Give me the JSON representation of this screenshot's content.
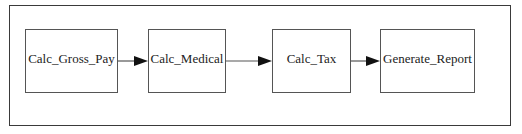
{
  "diagram": {
    "type": "flowchart",
    "direction": "left-to-right",
    "nodes": [
      {
        "id": "n1",
        "label": "Calc_Gross_Pay"
      },
      {
        "id": "n2",
        "label": "Calc_Medical"
      },
      {
        "id": "n3",
        "label": "Calc_Tax"
      },
      {
        "id": "n4",
        "label": "Generate_Report"
      }
    ],
    "edges": [
      {
        "from": "n1",
        "to": "n2"
      },
      {
        "from": "n2",
        "to": "n3"
      },
      {
        "from": "n3",
        "to": "n4"
      }
    ],
    "colors": {
      "stroke": "#555555",
      "frame": "#3a3a3a",
      "arrowhead": "#111111",
      "background": "#ffffff"
    }
  }
}
